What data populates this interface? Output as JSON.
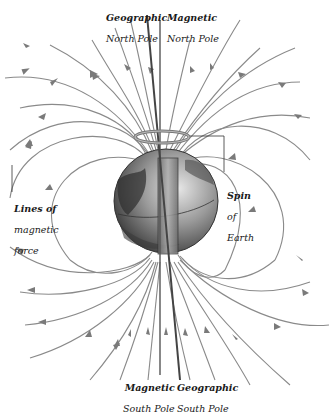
{
  "diagram": {
    "colors": {
      "field_line": "#8a8a8a",
      "arrow": "#7a7a7a",
      "globe_dark": "#3a3a3a",
      "globe_light": "#c8c8c8",
      "magnet": "#9a9a9a",
      "label": "#1a1a1a",
      "background": "#ffffff"
    },
    "labels": {
      "geographic_north_1": "Geographic",
      "geographic_north_2": "North Pole",
      "magnetic_north_1": "Magnetic",
      "magnetic_north_2": "North Pole",
      "lines_1": "Lines of",
      "lines_2": "magnetic",
      "lines_3": "force",
      "spin_1": "Spin",
      "spin_2": "of",
      "spin_3": "Earth",
      "magnetic_south_1": "Magnetic",
      "magnetic_south_2": "South Pole",
      "geographic_south_1": "Geographic",
      "geographic_south_2": "South Pole"
    },
    "elements": [
      "globe",
      "bar-magnet",
      "geographic-axis",
      "magnetic-axis",
      "spin-ring",
      "field-lines",
      "field-arrows"
    ]
  }
}
